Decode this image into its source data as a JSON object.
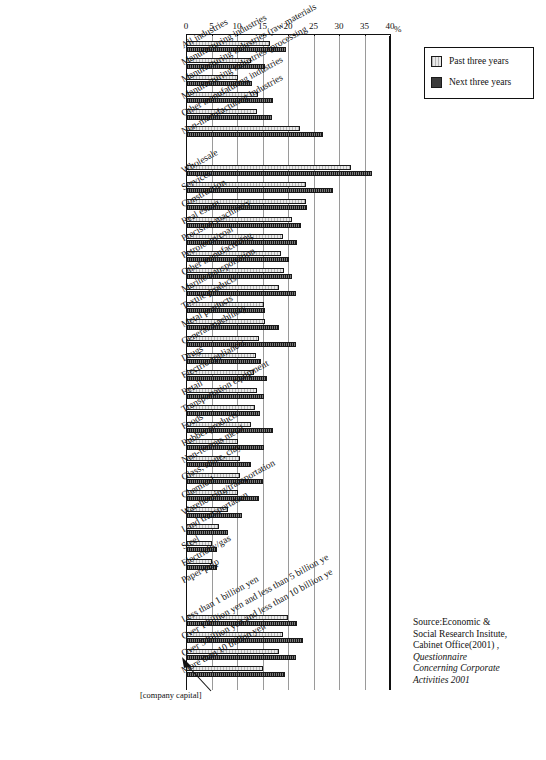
{
  "axis": {
    "unit": "%",
    "ticks": [
      0,
      5,
      10,
      15,
      20,
      25,
      30,
      35,
      40
    ],
    "min": 0,
    "max": 40
  },
  "legend": {
    "items": [
      {
        "label": "Past three years",
        "key": "past",
        "color": "#e9e9e9"
      },
      {
        "label": "Next three years",
        "key": "next",
        "color": "#3c3c3c"
      }
    ]
  },
  "annotation": {
    "capital": "[company capital]"
  },
  "source": {
    "line1": "Source:Economic &",
    "line2": "Social Research Insitute,",
    "line3": "Cabinet Office(2001) ,",
    "line4": "Questionnaire",
    "line5": "Concerning Corporate",
    "line6": "Activities 2001"
  },
  "chart_data": {
    "type": "bar",
    "orientation": "horizontal",
    "title": "",
    "xlabel": "%",
    "ylabel": "",
    "xlim": [
      0,
      40
    ],
    "grid": true,
    "legend_position": "top-right",
    "categories": [
      "All industries",
      "Manufacturing industries",
      "Manufacturing industries (raw materials",
      "Manufacturing industries (processing",
      "Other manufaturing industries",
      "Non-manufacturing industries",
      "Wholesale",
      "Services",
      "Construction",
      "Real estate",
      "Precision machinery",
      "Petroleum/coal",
      "Other manufacturing",
      "Marine transportation",
      "Textile products",
      "Metal products",
      "General machinery",
      "Drugs",
      "Electric appliances",
      "Retail",
      "Transportation equipment",
      "Foods",
      "Rubber products",
      "Non-ferrous metal",
      "Glass, stone, clay",
      "Chemical",
      "Warehousing/transportation",
      "Land transportation",
      "Steel",
      "Electricity/gas",
      "Paper-pulp",
      "Less than 1 billion yen",
      "Over 1 billion yen and less than 5 billion ye",
      "Over 5 billion yen and less than 10 billion ye",
      "More than 10 billion yen"
    ],
    "series": [
      {
        "name": "Past three years",
        "values": [
          16.5,
          12.8,
          10.2,
          14.2,
          14.0,
          22.3,
          32.3,
          23.6,
          23.5,
          20.8,
          19.0,
          18.7,
          19.2,
          18.2,
          15.3,
          15.5,
          14.3,
          13.8,
          13.3,
          14.0,
          13.5,
          12.7,
          10.2,
          10.5,
          10.5,
          10.2,
          8.3,
          6.5,
          5.0,
          5.0,
          0.0,
          20.0,
          19.0,
          18.2,
          15.0
        ]
      },
      {
        "name": "Next three years",
        "values": [
          19.6,
          15.5,
          12.9,
          17.0,
          16.8,
          26.8,
          36.4,
          28.8,
          23.7,
          22.5,
          21.8,
          20.2,
          20.7,
          21.5,
          15.5,
          18.2,
          21.5,
          14.7,
          15.8,
          15.2,
          14.6,
          17.0,
          15.3,
          12.8,
          15.0,
          14.3,
          11.0,
          8.2,
          6.0,
          6.0,
          0.0,
          21.8,
          23.0,
          21.6,
          19.5
        ]
      }
    ],
    "group_breaks": [
      6,
      31
    ]
  }
}
